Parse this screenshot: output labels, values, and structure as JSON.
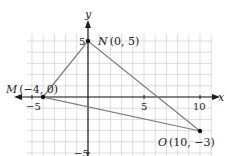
{
  "figure": {
    "type": "coordinate-plane-triangle",
    "axes": {
      "x_label": "x",
      "y_label": "y",
      "x_ticks": [
        {
          "value": -5,
          "label": "−5"
        },
        {
          "value": 5,
          "label": "5"
        },
        {
          "value": 10,
          "label": "10"
        }
      ],
      "y_ticks": [
        {
          "value": 5,
          "label": "5"
        },
        {
          "value": -5,
          "label": "−5"
        }
      ]
    },
    "points": [
      {
        "name": "M",
        "coords": "(−4, 0)",
        "x": -4,
        "y": 0
      },
      {
        "name": "N",
        "coords": "(0, 5)",
        "x": 0,
        "y": 5
      },
      {
        "name": "O",
        "coords": "(10, −3)",
        "x": 10,
        "y": -3
      }
    ],
    "colors": {
      "grid": "#d0d0d0",
      "axis": "#1a1a1a",
      "triangle": "#7a7a7a",
      "point": "#111111"
    }
  }
}
